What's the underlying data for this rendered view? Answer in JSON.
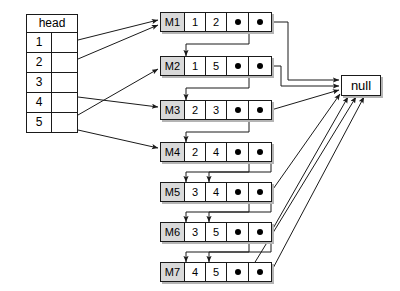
{
  "diagram": {
    "colors": {
      "stroke": "#1a1a1a",
      "label_fill": "#d9d9d9",
      "cell_fill": "#ffffff",
      "shadow": "#b4b4b4",
      "background": "#ffffff"
    }
  },
  "head_table": {
    "title": "head",
    "rows": [
      {
        "index": "1",
        "pointer": ""
      },
      {
        "index": "2",
        "pointer": ""
      },
      {
        "index": "3",
        "pointer": ""
      },
      {
        "index": "4",
        "pointer": ""
      },
      {
        "index": "5",
        "pointer": ""
      }
    ]
  },
  "nodes": [
    {
      "label": "M1",
      "v1": "1",
      "v2": "2",
      "p1": "●",
      "p2": "●"
    },
    {
      "label": "M2",
      "v1": "1",
      "v2": "5",
      "p1": "●",
      "p2": "●"
    },
    {
      "label": "M3",
      "v1": "2",
      "v2": "3",
      "p1": "●",
      "p2": "●"
    },
    {
      "label": "M4",
      "v1": "2",
      "v2": "4",
      "p1": "●",
      "p2": "●"
    },
    {
      "label": "M5",
      "v1": "3",
      "v2": "4",
      "p1": "●",
      "p2": "●"
    },
    {
      "label": "M6",
      "v1": "3",
      "v2": "5",
      "p1": "●",
      "p2": "●"
    },
    {
      "label": "M7",
      "v1": "4",
      "v2": "5",
      "p1": "●",
      "p2": "●"
    }
  ],
  "terminator": {
    "label": "null"
  }
}
